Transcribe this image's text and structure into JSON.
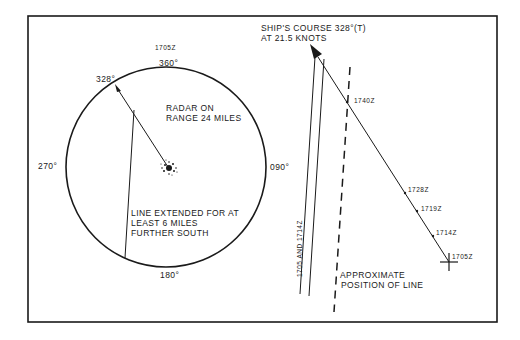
{
  "figure": {
    "radar_scope": {
      "time_label": "1705Z",
      "bearing_labels": {
        "north": "360°",
        "east": "090°",
        "south": "180°",
        "west": "270°",
        "course": "328°"
      },
      "range_note_line1": "RADAR ON",
      "range_note_line2": "RANGE 24 MILES",
      "extension_note_line1": "LINE EXTENDED FOR AT",
      "extension_note_line2": "LEAST 6 MILES",
      "extension_note_line3": "FURTHER SOUTH"
    },
    "plot": {
      "course_line1": "SHIP'S COURSE 328°(T)",
      "course_line2": "AT 21.5 KNOTS",
      "track_times": [
        "1740Z",
        "1728Z",
        "1719Z",
        "1714Z",
        "1705Z"
      ],
      "echo_lines_label": "1705 AND 1714Z",
      "approx_line1": "APPROXIMATE",
      "approx_line2": "POSITION OF LINE"
    },
    "colors": {
      "ink": "#1a1a1a",
      "paper": "#ffffff"
    }
  }
}
